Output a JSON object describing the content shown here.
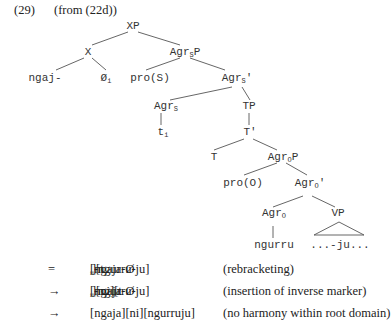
{
  "example": {
    "number": "(29)",
    "source": "(from (22d))"
  },
  "tree": {
    "nodes": {
      "XP": {
        "base": "XP",
        "sub": "",
        "suffix": ""
      },
      "X": {
        "base": "X",
        "sub": "",
        "suffix": ""
      },
      "AgrSP": {
        "base": "Agr",
        "sub": "S",
        "suffix": "P"
      },
      "ngaj": {
        "base": "ngaj-",
        "sub": "",
        "suffix": ""
      },
      "null_i": {
        "base": "Ø",
        "sub": "i",
        "suffix": ""
      },
      "proS": {
        "base": "pro(S)",
        "sub": "",
        "suffix": ""
      },
      "AgrSbar": {
        "base": "Agr",
        "sub": "S",
        "suffix": "'"
      },
      "AgrS": {
        "base": "Agr",
        "sub": "S",
        "suffix": ""
      },
      "TP": {
        "base": "TP",
        "sub": "",
        "suffix": ""
      },
      "t_i": {
        "base": "t",
        "sub": "i",
        "suffix": ""
      },
      "Tbar": {
        "base": "T'",
        "sub": "",
        "suffix": ""
      },
      "T": {
        "base": "T",
        "sub": "",
        "suffix": ""
      },
      "AgrOP": {
        "base": "Agr",
        "sub": "O",
        "suffix": "P"
      },
      "proO": {
        "base": "pro(O)",
        "sub": "",
        "suffix": ""
      },
      "AgrObar": {
        "base": "Agr",
        "sub": "O",
        "suffix": "'"
      },
      "AgrO": {
        "base": "Agr",
        "sub": "O",
        "suffix": ""
      },
      "VP": {
        "base": "VP",
        "sub": "",
        "suffix": ""
      },
      "ngurru": {
        "base": "ngurru",
        "sub": "",
        "suffix": ""
      },
      "ju": {
        "base": "...-ju...",
        "sub": "",
        "suffix": ""
      }
    }
  },
  "derivation": [
    {
      "op": "=",
      "form_a": "[ngaja-Ø",
      "form_a_sub": "i",
      "form_b": "][t",
      "form_b_sub": "i",
      "form_c": "-ngurru-ju]",
      "note": "(rebracketing)"
    },
    {
      "op": "→",
      "form_a": "[ngaja-Ø",
      "form_a_sub": "i",
      "form_b": "][ni][t",
      "form_b_sub": "i",
      "form_c": "-ngurru-ju]",
      "note": "(insertion of inverse marker)"
    },
    {
      "op": "→",
      "form_a": "[ngaja][ni][ngurruju]",
      "form_a_sub": "",
      "form_b": "",
      "form_b_sub": "",
      "form_c": "",
      "note": "(no harmony within root domain)"
    }
  ]
}
